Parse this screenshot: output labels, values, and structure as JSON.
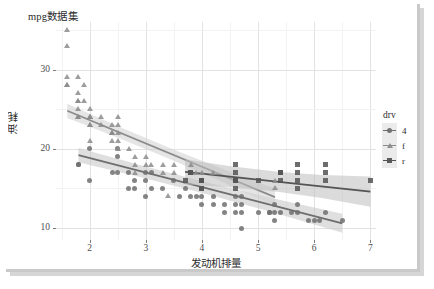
{
  "chart_data": {
    "type": "scatter",
    "title": "mpg数据集",
    "xlabel": "发动机排量",
    "ylabel": "油耗",
    "xlim": [
      1.4,
      7.1
    ],
    "ylim": [
      8.5,
      36
    ],
    "xticks": [
      "2",
      "3",
      "4",
      "5",
      "6",
      "7"
    ],
    "xtick_values": [
      2,
      3,
      4,
      5,
      6,
      7
    ],
    "yticks": [
      "10",
      "20",
      "30"
    ],
    "ytick_values": [
      10,
      20,
      30
    ],
    "grid": true,
    "legend": {
      "title": "drv",
      "position": "right",
      "entries": [
        {
          "label": "4",
          "shape": "circle",
          "color": "#6e6e6e"
        },
        {
          "label": "f",
          "shape": "triangle",
          "color": "#8c8c8c"
        },
        {
          "label": "r",
          "shape": "square",
          "color": "#545454"
        }
      ]
    },
    "smooth_method": "lm",
    "series": [
      {
        "name": "4",
        "shape": "circle",
        "color": "#6e6e6e",
        "ribbon_color": "#c4c4c4",
        "fit": {
          "x0": 1.8,
          "y0": 19.2,
          "x1": 6.5,
          "y1": 10.6
        },
        "ribbon_halfwidth": {
          "left": 0.9,
          "mid": 0.45,
          "right": 1.2
        },
        "points": [
          [
            1.8,
            18
          ],
          [
            1.8,
            18
          ],
          [
            2.0,
            16
          ],
          [
            2.0,
            20
          ],
          [
            2.5,
            19
          ],
          [
            2.5,
            20
          ],
          [
            2.7,
            15
          ],
          [
            2.7,
            17
          ],
          [
            3.0,
            17
          ],
          [
            3.0,
            16
          ],
          [
            3.1,
            17
          ],
          [
            3.1,
            15
          ],
          [
            3.7,
            15
          ],
          [
            3.9,
            14
          ],
          [
            4.0,
            14
          ],
          [
            4.0,
            15
          ],
          [
            4.0,
            16
          ],
          [
            4.0,
            15
          ],
          [
            4.2,
            14
          ],
          [
            4.4,
            13
          ],
          [
            4.6,
            14
          ],
          [
            4.6,
            13
          ],
          [
            4.7,
            14
          ],
          [
            4.7,
            13
          ],
          [
            4.7,
            12
          ],
          [
            5.2,
            12
          ],
          [
            5.2,
            12
          ],
          [
            5.3,
            12
          ],
          [
            5.3,
            13
          ],
          [
            5.3,
            11
          ],
          [
            5.4,
            12
          ],
          [
            5.7,
            12
          ],
          [
            5.9,
            11
          ],
          [
            6.0,
            11
          ],
          [
            6.2,
            12
          ],
          [
            6.5,
            11
          ],
          [
            2.8,
            16
          ],
          [
            2.8,
            15
          ],
          [
            3.3,
            15
          ],
          [
            3.5,
            16
          ],
          [
            3.6,
            14
          ],
          [
            3.8,
            14
          ],
          [
            4.0,
            13
          ],
          [
            4.2,
            13
          ],
          [
            4.4,
            12
          ],
          [
            4.6,
            12
          ],
          [
            5.0,
            12
          ],
          [
            5.6,
            12
          ],
          [
            2.4,
            17
          ],
          [
            2.5,
            17
          ],
          [
            3.0,
            14
          ],
          [
            4.7,
            10
          ],
          [
            5.7,
            13
          ],
          [
            6.1,
            11
          ]
        ]
      },
      {
        "name": "f",
        "shape": "triangle",
        "color": "#8c8c8c",
        "ribbon_color": "#cfcfcf",
        "fit": {
          "x0": 1.6,
          "y0": 24.8,
          "x1": 5.3,
          "y1": 13.9
        },
        "ribbon_halfwidth": {
          "left": 0.9,
          "mid": 0.4,
          "right": 1.1
        },
        "points": [
          [
            1.6,
            33
          ],
          [
            1.6,
            35
          ],
          [
            1.6,
            29
          ],
          [
            1.6,
            28
          ],
          [
            1.6,
            28
          ],
          [
            1.8,
            26
          ],
          [
            1.8,
            27
          ],
          [
            1.8,
            26
          ],
          [
            1.8,
            25
          ],
          [
            1.8,
            24
          ],
          [
            1.8,
            24
          ],
          [
            1.9,
            26
          ],
          [
            2.0,
            25
          ],
          [
            2.0,
            24
          ],
          [
            2.0,
            24
          ],
          [
            2.0,
            23
          ],
          [
            2.0,
            24
          ],
          [
            2.0,
            23
          ],
          [
            2.2,
            24
          ],
          [
            2.4,
            22
          ],
          [
            2.4,
            22
          ],
          [
            2.4,
            21
          ],
          [
            2.4,
            22
          ],
          [
            2.5,
            23
          ],
          [
            2.5,
            22
          ],
          [
            2.5,
            21
          ],
          [
            2.5,
            20
          ],
          [
            2.7,
            20
          ],
          [
            2.8,
            19
          ],
          [
            2.8,
            18
          ],
          [
            3.0,
            19
          ],
          [
            3.0,
            18
          ],
          [
            3.1,
            18
          ],
          [
            3.3,
            18
          ],
          [
            3.3,
            17
          ],
          [
            3.5,
            18
          ],
          [
            3.5,
            17
          ],
          [
            3.8,
            18
          ],
          [
            3.8,
            17
          ],
          [
            3.8,
            17
          ],
          [
            3.9,
            17
          ],
          [
            4.0,
            17
          ],
          [
            4.2,
            17
          ],
          [
            4.6,
            16
          ],
          [
            5.3,
            16
          ],
          [
            5.3,
            15
          ],
          [
            3.4,
            14
          ],
          [
            2.0,
            21
          ],
          [
            2.4,
            23
          ],
          [
            2.5,
            24
          ],
          [
            1.8,
            29
          ],
          [
            1.9,
            28
          ],
          [
            2.2,
            23
          ],
          [
            2.8,
            17
          ]
        ]
      },
      {
        "name": "r",
        "shape": "square",
        "color": "#545454",
        "ribbon_color": "#bdbdbd",
        "fit": {
          "x0": 3.7,
          "y0": 17.1,
          "x1": 7.0,
          "y1": 14.6
        },
        "ribbon_halfwidth": {
          "left": 1.6,
          "mid": 0.8,
          "right": 1.9
        },
        "points": [
          [
            3.7,
            16
          ],
          [
            3.8,
            17
          ],
          [
            3.8,
            17
          ],
          [
            4.0,
            16
          ],
          [
            4.0,
            16
          ],
          [
            4.6,
            17
          ],
          [
            4.6,
            16
          ],
          [
            4.6,
            16
          ],
          [
            5.0,
            16
          ],
          [
            5.4,
            17
          ],
          [
            5.4,
            17
          ],
          [
            5.7,
            18
          ],
          [
            5.7,
            17
          ],
          [
            6.2,
            18
          ],
          [
            6.2,
            17
          ],
          [
            7.0,
            16
          ],
          [
            5.7,
            16
          ],
          [
            6.2,
            16
          ],
          [
            4.0,
            15
          ],
          [
            4.6,
            15
          ],
          [
            5.7,
            15
          ],
          [
            5.4,
            16
          ],
          [
            4.6,
            18
          ]
        ]
      }
    ]
  }
}
